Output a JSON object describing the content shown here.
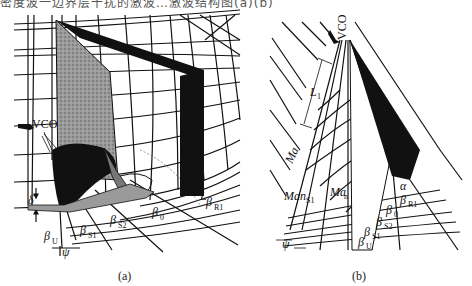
{
  "header": {
    "cut_off_caption": "密度波一边界层干扰的激波…激波结构图(a)(b)"
  },
  "figure": {
    "panel_a": {
      "caption": "(a)",
      "labels": {
        "vco": "VCO",
        "delta": "δ",
        "beta_u": "β",
        "beta_u_sub": "U",
        "psi": "ψ",
        "beta_s1": "β",
        "beta_s1_sub": "S1",
        "beta_s2": "β",
        "beta_s2_sub": "S2",
        "beta_0": "β",
        "beta_0_sub": "0",
        "l": "L",
        "beta_r1": "β",
        "beta_r1_sub": "R1"
      }
    },
    "panel_b": {
      "caption": "(b)",
      "labels": {
        "vco": "VCO",
        "l1": "L",
        "l1_sub": "1",
        "ma_inf": "Ma",
        "ma_inf_sub": "∞",
        "man_s1": "Man",
        "man_s1_sub": "S1",
        "ma_n": "Ma",
        "ma_n_sub": "n",
        "alpha": "α",
        "beta_r1": "β",
        "beta_r1_sub": "R1",
        "beta_0": "β",
        "beta_0_sub": "0",
        "beta_s2": "β",
        "beta_s2_sub": "S2",
        "beta_s1": "β",
        "beta_s1_sub": "S1",
        "beta_u": "β",
        "beta_u_sub": "U",
        "psi": "ψ"
      }
    },
    "colors": {
      "ink": "#111111",
      "stipple": "#8a8a8a",
      "grey_band": "#9a9a9a"
    }
  }
}
